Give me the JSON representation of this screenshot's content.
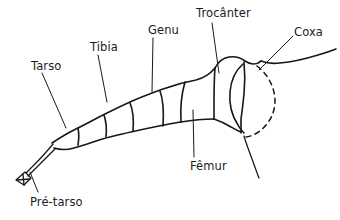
{
  "figure": {
    "background_color": "#ffffff",
    "ink_color": "#17171a",
    "text_color": "#1b1b1e"
  },
  "labels": {
    "tarso": "Tarso",
    "pretarso": "Pré-tarso",
    "tibia": "Tibia",
    "genu": "Genu",
    "trocanter": "Trocânter",
    "coxa": "Coxa",
    "femur": "Fêmur"
  }
}
